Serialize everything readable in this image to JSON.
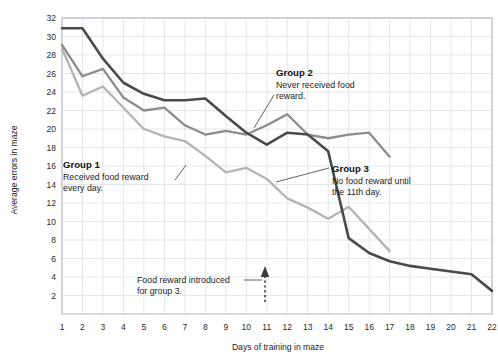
{
  "chart_data": {
    "type": "line",
    "title": "",
    "subtitle": "",
    "xlabel": "Days of training in maze",
    "ylabel": "Average errors in maze",
    "xlim": [
      1,
      22
    ],
    "ylim": [
      0,
      32
    ],
    "yticks": [
      2,
      4,
      6,
      8,
      10,
      12,
      14,
      16,
      18,
      20,
      22,
      24,
      26,
      28,
      30,
      32
    ],
    "xticks": [
      1,
      2,
      3,
      4,
      5,
      6,
      7,
      8,
      9,
      10,
      11,
      12,
      13,
      14,
      15,
      16,
      17,
      18,
      19,
      20,
      21,
      22
    ],
    "grid": true,
    "legend_position": "inline-annotations",
    "series": [
      {
        "name": "Group 3",
        "color": "#4a4a4a",
        "linewidth": 2.6,
        "x": [
          1,
          2,
          3,
          4,
          5,
          6,
          7,
          8,
          9,
          10,
          11,
          12,
          13,
          14,
          15,
          16,
          17,
          18,
          19,
          20,
          21,
          22
        ],
        "values": [
          30.9,
          30.9,
          27.6,
          25.0,
          23.8,
          23.1,
          23.1,
          23.3,
          21.4,
          19.6,
          18.3,
          19.6,
          19.4,
          17.6,
          8.2,
          6.6,
          5.7,
          5.2,
          4.9,
          4.6,
          4.3,
          2.5
        ]
      },
      {
        "name": "Group 2",
        "color": "#8c8c8c",
        "linewidth": 2.3,
        "x": [
          1,
          2,
          3,
          4,
          5,
          6,
          7,
          8,
          9,
          10,
          11,
          12,
          13,
          14,
          15,
          16,
          17
        ],
        "values": [
          29.1,
          25.7,
          26.5,
          23.4,
          22.0,
          22.3,
          20.4,
          19.4,
          19.8,
          19.4,
          20.4,
          21.6,
          19.4,
          19.0,
          19.4,
          19.6,
          17.0
        ]
      },
      {
        "name": "Group 1",
        "color": "#b4b4b4",
        "linewidth": 2.3,
        "x": [
          1,
          2,
          3,
          4,
          5,
          6,
          7,
          8,
          9,
          10,
          11,
          12,
          13,
          14,
          15,
          16,
          17
        ],
        "values": [
          28.7,
          23.6,
          24.6,
          22.3,
          20.0,
          19.2,
          18.7,
          17.1,
          15.3,
          15.8,
          14.6,
          12.5,
          11.5,
          10.3,
          11.6,
          9.2,
          6.8
        ]
      }
    ],
    "annotations": [
      {
        "id": "group-1",
        "title": "Group 1",
        "body_line1": "Received food reward",
        "body_line2": "every day."
      },
      {
        "id": "group-2",
        "title": "Group 2",
        "body_line1": "Never received food",
        "body_line2": "reward."
      },
      {
        "id": "group-3",
        "title": "Group 3",
        "body_line1": "No food reward until",
        "body_line2": "the 11th day."
      },
      {
        "id": "food-reward-note",
        "title": "",
        "body_line1": "Food reward introduced",
        "body_line2": "for group 3.",
        "marker_day": 11
      }
    ]
  },
  "axis": {
    "y_label": "Average errors in maze",
    "x_label": "Days of training in maze",
    "y_ticks": [
      "2",
      "4",
      "6",
      "8",
      "10",
      "12",
      "14",
      "16",
      "18",
      "20",
      "22",
      "24",
      "26",
      "28",
      "30",
      "32"
    ],
    "x_ticks": [
      "1",
      "2",
      "3",
      "4",
      "5",
      "6",
      "7",
      "8",
      "9",
      "10",
      "11",
      "12",
      "13",
      "14",
      "15",
      "16",
      "17",
      "18",
      "19",
      "20",
      "21",
      "22"
    ]
  },
  "annotations": {
    "group1": {
      "title": "Group 1",
      "line1": "Received food reward",
      "line2": "every day."
    },
    "group2": {
      "title": "Group 2",
      "line1": "Never received food",
      "line2": "reward."
    },
    "group3": {
      "title": "Group 3",
      "line1": "No food reward until",
      "line2": "the 11th day."
    },
    "note": {
      "line1": "Food reward introduced",
      "line2": "for group 3."
    }
  },
  "colors": {
    "group1": "#b4b4b4",
    "group2": "#8c8c8c",
    "group3": "#4a4a4a",
    "grid": "#d9dde4",
    "border": "#aeb4bd",
    "text": "#1d1d1d"
  }
}
